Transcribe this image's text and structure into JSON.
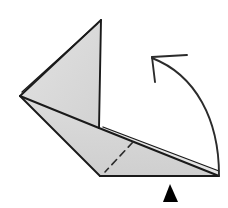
{
  "figure": {
    "canvas": {
      "width": 228,
      "height": 208,
      "background": "#ffffff"
    },
    "colors": {
      "paper_fill": "#d9d9d9",
      "paper_fill_light": "#e4e4e4",
      "paper_fill_shadow": "#c9c9c9",
      "outline": "#1a1a1a",
      "crease_dashed": "#2b2b2b",
      "arrow": "#2b2b2b",
      "marker": "#000000",
      "background": "#ffffff"
    },
    "shapes": {
      "upper_flap": {
        "label": "upper triangular flap",
        "points": "101,20 99,128 20,96",
        "fill": "#d9d9d9"
      },
      "upper_flap_sliver": {
        "label": "folded layer edge of upper flap",
        "points": "20,96 22,92 97,24 101,20",
        "fill": "#e4e4e4"
      },
      "lower_flap": {
        "label": "lower flap panel",
        "points": "20,96 99,128 219,176 100,176",
        "fill": "#d9d9d9"
      },
      "lower_flap_sliver": {
        "label": "folded layer edge of lower flap",
        "points": "99,128 219,176 219,171 103,127",
        "fill": "#e4e4e4"
      }
    },
    "edges": [
      {
        "name": "upper-flap-left-edge",
        "from": "101,20",
        "to": "20,96"
      },
      {
        "name": "upper-flap-right-edge",
        "from": "101,20",
        "to": "99,128"
      },
      {
        "name": "upper-flap-base-edge",
        "from": "20,96",
        "to": "99,128"
      },
      {
        "name": "lower-flap-left-edge",
        "from": "20,96",
        "to": "100,176"
      },
      {
        "name": "lower-flap-bottom-edge",
        "from": "100,176",
        "to": "219,176"
      },
      {
        "name": "lower-flap-diagonal-edge",
        "from": "99,128",
        "to": "219,176"
      }
    ],
    "crease": {
      "name": "valley-fold-crease",
      "style": "dashed",
      "from": "133,142",
      "to": "105,172"
    },
    "arrow": {
      "name": "rotation-arrow",
      "direction": "counterclockwise up-left",
      "tip": "152,57",
      "tail": "219,175",
      "path": "M 219,175 C 219,120 196,75 152,58",
      "head_barb_1": "152,57 187,55",
      "head_barb_2": "152,57 155,82"
    },
    "marker": {
      "name": "position-marker",
      "shape": "solid-triangle",
      "points": "170,184 178,202 163,202",
      "fill": "#000000"
    }
  }
}
